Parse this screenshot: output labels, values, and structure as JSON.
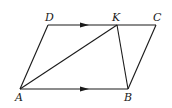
{
  "diagram": {
    "type": "geometry",
    "points": {
      "A": {
        "label": "A",
        "x": 20,
        "y": 89
      },
      "B": {
        "label": "B",
        "x": 128,
        "y": 89
      },
      "C": {
        "label": "C",
        "x": 156,
        "y": 25
      },
      "D": {
        "label": "D",
        "x": 48,
        "y": 25
      },
      "K": {
        "label": "K",
        "x": 117,
        "y": 25
      }
    },
    "segments": [
      "AB",
      "BC",
      "CD",
      "DA",
      "AK",
      "KB"
    ],
    "parallel_marks": [
      "DC",
      "AB"
    ],
    "color": "#1a1a1a"
  }
}
